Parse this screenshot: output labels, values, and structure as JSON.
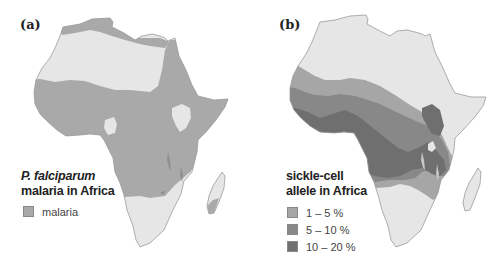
{
  "panels": [
    {
      "label": "(a)",
      "legend": {
        "title_line1": "P. falciparum",
        "title_line2": "malaria in Africa",
        "items": [
          {
            "label": "malaria",
            "color": "#a9a9a9"
          }
        ]
      },
      "colors": {
        "no_data_land": "#e6e6e6",
        "malaria": "#a9a9a9",
        "outline": "#9a9a9a"
      }
    },
    {
      "label": "(b)",
      "legend": {
        "title_line1": "sickle-cell",
        "title_line2": "allele in Africa",
        "items": [
          {
            "label": "1 – 5 %",
            "color": "#a6a6a6"
          },
          {
            "label": "5 – 10 %",
            "color": "#888888"
          },
          {
            "label": "10 – 20 %",
            "color": "#6f6f6f"
          }
        ]
      },
      "colors": {
        "no_data_land": "#e6e6e6",
        "outline": "#9a9a9a"
      }
    }
  ]
}
